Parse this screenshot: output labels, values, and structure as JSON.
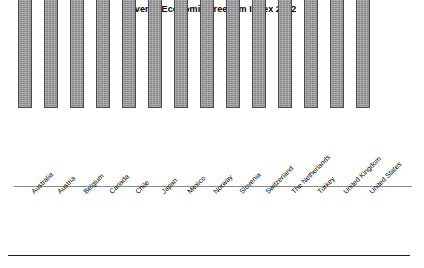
{
  "chart_data": {
    "type": "bar",
    "title": "Overall Economic Freedom Index 2012",
    "xlabel": "",
    "ylabel": "",
    "ylim": [
      0,
      90
    ],
    "grid": false,
    "legend": null,
    "axis_style": {
      "baseline_only": true,
      "y_axis_visible": false,
      "tick_labels_visible": false,
      "category_label_rotation_deg": -45
    },
    "bar_style": {
      "fill": "#9a9a9a",
      "border": "#4a4a4a",
      "texture": "speckled-gray"
    },
    "categories": [
      "Australia",
      "Austria",
      "Belgium",
      "Canada",
      "Chile",
      "Japan",
      "Mexico",
      "Norway",
      "Slovenia",
      "Switzerland",
      "The Netherlands",
      "Turkey",
      "United Kingdom",
      "United States"
    ],
    "values": [
      83.1,
      70.3,
      69,
      79.9,
      78.3,
      71.6,
      65.3,
      68.8,
      62.9,
      81.1,
      73.3,
      62.5,
      74.1,
      76.3
    ],
    "value_labels": [
      "83.1",
      "70.3",
      "69",
      "79.9",
      "78.3",
      "71.6",
      "65.3",
      "68.8",
      "62.9",
      "81.1",
      "73.3",
      "62.5",
      "74.1",
      "76.3"
    ]
  }
}
